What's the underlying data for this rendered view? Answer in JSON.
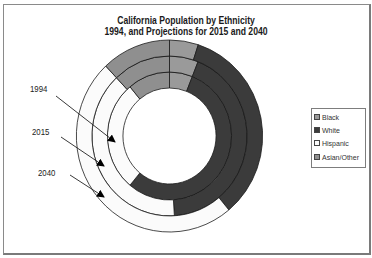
{
  "chart_data": {
    "type": "doughnut",
    "title_lines": [
      "California Population by Ethnicity",
      "1994, and Projections for 2015 and 2040"
    ],
    "categories": [
      "Black",
      "White",
      "Hispanic",
      "Asian/Other"
    ],
    "series": [
      {
        "name": "1994",
        "ring": "inner",
        "values": [
          6,
          55,
          28,
          11
        ]
      },
      {
        "name": "2015",
        "ring": "middle",
        "values": [
          6,
          43,
          39,
          12
        ]
      },
      {
        "name": "2040",
        "ring": "outer",
        "values": [
          5,
          34,
          49,
          12
        ]
      }
    ],
    "value_unit": "percent of population (estimated from slice angles)",
    "start_angle_deg": 0,
    "direction": "clockwise",
    "legend": {
      "position": "right",
      "entries": [
        {
          "label": "Black",
          "color": "#9a9a9a"
        },
        {
          "label": "White",
          "color": "#3b3b3b"
        },
        {
          "label": "Hispanic",
          "color": "#fbfbfb"
        },
        {
          "label": "Asian/Other",
          "color": "#8f8f8f"
        }
      ]
    },
    "ring_labels": [
      {
        "label": "1994",
        "x": 30,
        "y": 86,
        "arrow_from": [
          56,
          96
        ],
        "arrow_to": [
          115,
          142
        ]
      },
      {
        "label": "2015",
        "x": 32,
        "y": 129,
        "arrow_from": [
          61,
          137
        ],
        "arrow_to": [
          104,
          166
        ]
      },
      {
        "label": "2040",
        "x": 38,
        "y": 170,
        "arrow_from": [
          70,
          175
        ],
        "arrow_to": [
          104,
          197
        ]
      }
    ],
    "grid": false
  }
}
